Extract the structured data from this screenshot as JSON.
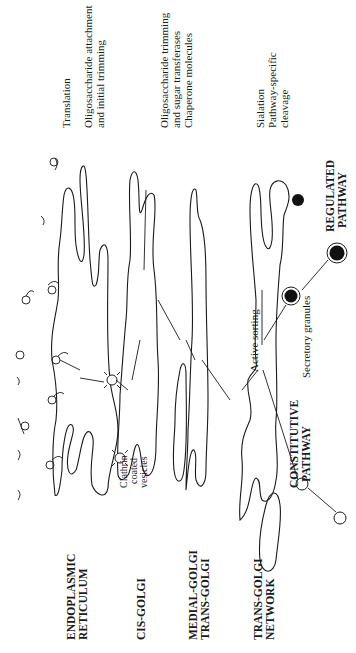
{
  "diagram": {
    "orientation": "rotated-90-ccw",
    "compartments": [
      {
        "id": "er",
        "label_lines": [
          "ENDOPLASMIC",
          "RETICULUM"
        ],
        "function_lines": [
          "Translation",
          "Oligosaccharide attachment",
          "and initial trimming"
        ]
      },
      {
        "id": "cis",
        "label_lines": [
          "CIS-GOLGI"
        ],
        "function_lines": [
          "Oligosaccharide trimming",
          "and sugar transferases",
          "Chaperone molecules"
        ]
      },
      {
        "id": "medial",
        "label_lines": [
          "MEDIAL-GOLGI",
          "TRANS-GOLGI"
        ],
        "function_lines": []
      },
      {
        "id": "tgn",
        "label_lines": [
          "TRANS-GOLGI",
          "NETWORK"
        ],
        "function_lines": [
          "Sialation",
          "Pathway-specific",
          "cleavage"
        ]
      }
    ],
    "annotations": {
      "clathrin": [
        "Clathrin",
        "coated",
        "vesicles"
      ],
      "active_sorting": "Active sorting",
      "secretory_granules": "Secretory granules",
      "constitutive": [
        "CONSTITUTIVE",
        "PATHWAY"
      ],
      "regulated": [
        "REGULATED",
        "PATHWAY"
      ]
    }
  }
}
